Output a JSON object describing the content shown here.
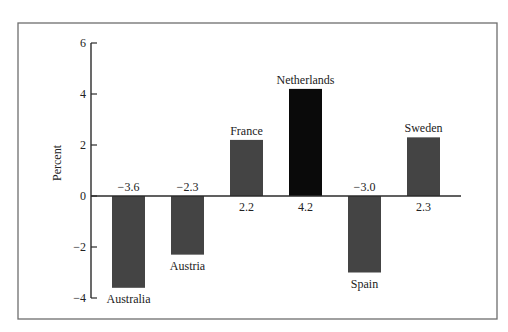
{
  "chart_data": {
    "type": "bar",
    "title": "",
    "xlabel": "",
    "ylabel": "Percent",
    "ylim": [
      -4,
      6
    ],
    "yticks": [
      6,
      4,
      2,
      0,
      -2,
      -4
    ],
    "ytick_labels": [
      "6",
      "4",
      "2",
      "0",
      "−2",
      "−4"
    ],
    "grid": false,
    "legend": "none",
    "categories": [
      "Australia",
      "Austria",
      "France",
      "Netherlands",
      "Spain",
      "Sweden"
    ],
    "values": [
      -3.6,
      -2.3,
      2.2,
      4.2,
      -3.0,
      2.3
    ],
    "value_labels": [
      "−3.6",
      "−2.3",
      "2.2",
      "4.2",
      "−3.0",
      "2.3"
    ],
    "bar_colors": [
      "#444444",
      "#444444",
      "#444444",
      "#0a0a0a",
      "#444444",
      "#444444"
    ],
    "annotations": "Country names are written at the bar end away from zero; values are written on the opposite side of the zero line."
  }
}
